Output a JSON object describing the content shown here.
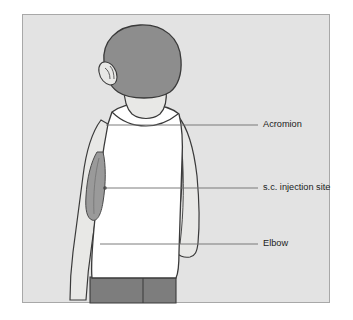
{
  "figure": {
    "view": "posterior view of a child",
    "panel": {
      "background_color": "#e3e3e3",
      "border_color": "#a8a8a8",
      "page_background": "#ffffff"
    },
    "colors": {
      "hair": "#8d8d8d",
      "skin": "#e8e8e6",
      "shirt": "#ffffff",
      "shorts": "#7d7d7d",
      "outline": "#3a3a3a",
      "injection_patch": "#9a9a9a",
      "leader_line": "#6e6e6e",
      "label_text": "#1b1b1b"
    },
    "subject": {
      "hair_label": "hair",
      "ear_label": "ear",
      "tank_top_label": "sleeveless-shirt",
      "shorts_label": "shorts",
      "left_arm_label": "left-arm",
      "right_arm_label": "right-arm"
    },
    "callouts": [
      {
        "id": "acromion",
        "label": "Acromion",
        "anchor_x": 106,
        "anchor_y": 125,
        "line_end_x": 258,
        "label_x": 263,
        "label_y": 125,
        "marker": "none"
      },
      {
        "id": "sc-injection-site",
        "label": "s.c. injection site",
        "anchor_x": 105,
        "anchor_y": 188,
        "line_end_x": 258,
        "label_x": 263,
        "label_y": 188,
        "marker": "dot"
      },
      {
        "id": "elbow",
        "label": "Elbow",
        "anchor_x": 100,
        "anchor_y": 244,
        "line_end_x": 258,
        "label_x": 263,
        "label_y": 244,
        "marker": "none"
      }
    ]
  }
}
